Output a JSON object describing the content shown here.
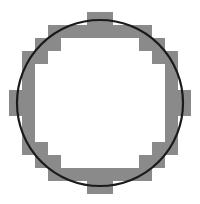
{
  "figure": {
    "width": 200,
    "height": 204,
    "background_color": "#ffffff"
  },
  "chart_data": {
    "type": "diagram",
    "xlabel": "",
    "ylabel": "",
    "grid": false,
    "legend": null,
    "ideal_circle": {
      "name": "smooth circle outline",
      "center_x": 100,
      "center_y": 103,
      "radius": 83,
      "stroke_color": "#1a1a1a",
      "stroke_width": 2.2,
      "fill": "none"
    },
    "raster_annulus": {
      "name": "pixelated circle band",
      "fill_color": "#8a8a8a",
      "cell_size": 13,
      "grid_origin_x": 9,
      "grid_origin_y": 12,
      "outer_radius_cells": 6.6,
      "inner_radius_cells": 5.4,
      "note": "square cells whose centers fall between the inner and outer radius are filled"
    }
  },
  "colors": {
    "gray_block": "#8a8a8a",
    "circle_stroke": "#1a1a1a",
    "background": "#ffffff"
  }
}
